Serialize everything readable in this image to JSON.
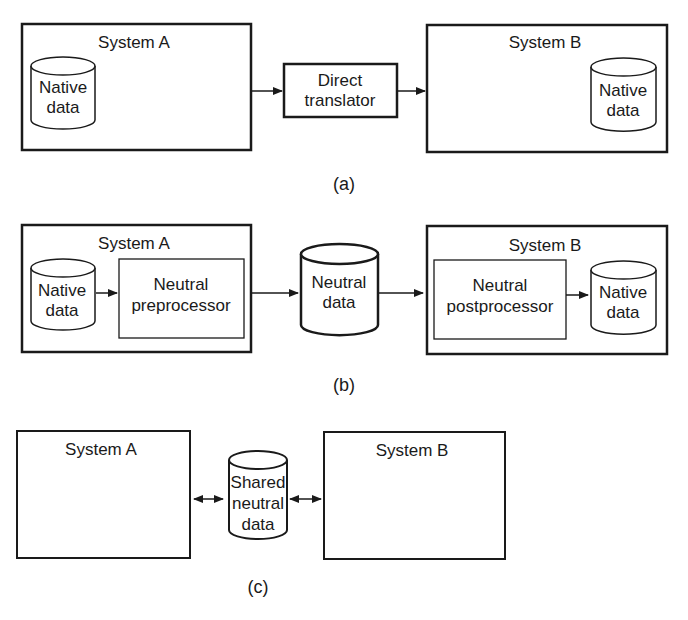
{
  "colors": {
    "stroke": "#1a1a1a",
    "background": "#ffffff"
  },
  "panel_a": {
    "caption": "(a)",
    "system_a": {
      "title": "System A",
      "db": [
        "Native",
        "data"
      ]
    },
    "translator": [
      "Direct",
      "translator"
    ],
    "system_b": {
      "title": "System B",
      "db": [
        "Native",
        "data"
      ]
    }
  },
  "panel_b": {
    "caption": "(b)",
    "system_a": {
      "title": "System A",
      "db": [
        "Native",
        "data"
      ],
      "processor": [
        "Neutral",
        "preprocessor"
      ]
    },
    "neutral_db": [
      "Neutral",
      "data"
    ],
    "system_b": {
      "title": "System B",
      "processor": [
        "Neutral",
        "postprocessor"
      ],
      "db": [
        "Native",
        "data"
      ]
    }
  },
  "panel_c": {
    "caption": "(c)",
    "system_a": {
      "title": "System A"
    },
    "shared_db": [
      "Shared",
      "neutral",
      "data"
    ],
    "system_b": {
      "title": "System B"
    }
  }
}
